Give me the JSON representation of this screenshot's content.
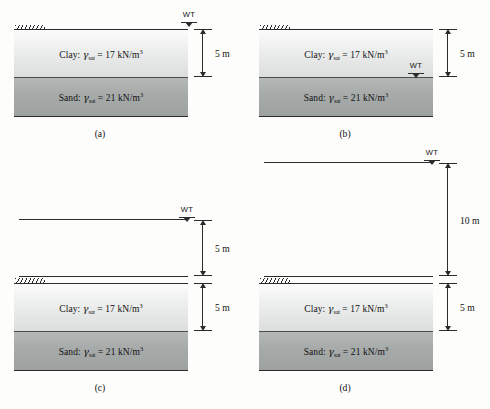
{
  "figure": {
    "colors": {
      "line": "#2b2b2b",
      "clay_top": "#fbfbfb",
      "clay_bottom": "#dcdedd",
      "sand_top": "#b4b8b7",
      "sand_bottom": "#9da1a0",
      "background": "#fdfdfc"
    },
    "soil_layers": {
      "clay": {
        "name": "Clay",
        "symbol": "γ",
        "subscript": "sat",
        "equals": "=",
        "value": "17",
        "unit": "kN/m",
        "exponent": "3",
        "full_text": "Clay: γsat = 17 kN/m3"
      },
      "sand": {
        "name": "Sand",
        "symbol": "γ",
        "subscript": "sat",
        "equals": "=",
        "value": "21",
        "unit": "kN/m",
        "exponent": "3",
        "full_text": "Sand: γsat = 21 kN/m3"
      }
    },
    "water_table_label": "WT",
    "panels": [
      {
        "id": "a",
        "caption": "(a)",
        "water_table_position": "at ground surface",
        "dimensions": [
          {
            "label": "5 m",
            "value": 5,
            "unit": "m",
            "spans": "clay layer thickness"
          }
        ]
      },
      {
        "id": "b",
        "caption": "(b)",
        "water_table_position": "at clay-sand interface",
        "dimensions": [
          {
            "label": "5 m",
            "value": 5,
            "unit": "m",
            "spans": "clay layer thickness"
          }
        ]
      },
      {
        "id": "c",
        "caption": "(c)",
        "water_table_position": "5 m above ground surface",
        "dimensions": [
          {
            "label": "5 m",
            "value": 5,
            "unit": "m",
            "spans": "water above ground"
          },
          {
            "label": "5 m",
            "value": 5,
            "unit": "m",
            "spans": "clay layer thickness"
          }
        ]
      },
      {
        "id": "d",
        "caption": "(d)",
        "water_table_position": "10 m above ground surface",
        "dimensions": [
          {
            "label": "10 m",
            "value": 10,
            "unit": "m",
            "spans": "water above ground"
          },
          {
            "label": "5 m",
            "value": 5,
            "unit": "m",
            "spans": "clay layer thickness"
          }
        ]
      }
    ]
  }
}
